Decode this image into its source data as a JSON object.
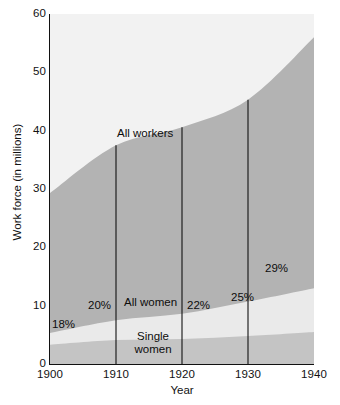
{
  "chart_data": {
    "type": "area",
    "title": "",
    "subtitle": "",
    "xlabel": "Year",
    "ylabel": "Work force (in millions)",
    "xlim": [
      1900,
      1940
    ],
    "ylim": [
      0,
      60
    ],
    "xticks": [
      1900,
      1910,
      1920,
      1930,
      1940
    ],
    "yticks": [
      0,
      10,
      20,
      30,
      40,
      50,
      60
    ],
    "grid": false,
    "legend": "inline-annotations",
    "stacked": false,
    "x": [
      1900,
      1910,
      1920,
      1930,
      1940
    ],
    "series": [
      {
        "name": "All workers",
        "values": [
          29.3,
          37.5,
          40.6,
          45.3,
          56.0
        ],
        "color": "#b3b3b3",
        "label": "All workers"
      },
      {
        "name": "All women",
        "values": [
          5.3,
          7.5,
          8.6,
          10.7,
          13.0
        ],
        "color": "#eaeaea",
        "label": "All women"
      },
      {
        "name": "Single women",
        "values": [
          3.3,
          4.1,
          4.3,
          4.8,
          5.5
        ],
        "color": "#c4c4c4",
        "label": "Single women"
      }
    ],
    "annotations": [
      {
        "text": "18%",
        "x": 1901,
        "y": 6.6
      },
      {
        "text": "20%",
        "x": 1907.5,
        "y": 9.6
      },
      {
        "text": "22%",
        "x": 1921,
        "y": 9.6
      },
      {
        "text": "25%",
        "x": 1928,
        "y": 10.9
      },
      {
        "text": "29%",
        "x": 1936,
        "y": 15.0
      }
    ],
    "percent_labels": [
      "18%",
      "20%",
      "22%",
      "25%",
      "29%"
    ],
    "reference_lines": [
      1910,
      1920,
      1930
    ],
    "colors": {
      "plot_background": "#f2f2f2",
      "all_workers_fill": "#b3b3b3",
      "all_women_fill": "#eaeaea",
      "single_women_fill": "#c4c4c4",
      "axis": "#111111",
      "text": "#0d0d0d"
    }
  },
  "axes": {
    "y_title": "Work force (in millions)",
    "x_title": "Year",
    "y_tick_labels": [
      "60",
      "50",
      "40",
      "30",
      "20",
      "10",
      "0"
    ],
    "x_tick_labels": [
      "1900",
      "1910",
      "1920",
      "1930",
      "1940"
    ]
  },
  "labels": {
    "all_workers": "All workers",
    "all_women": "All women",
    "single_women_line1": "Single",
    "single_women_line2": "women",
    "pct_1900": "18%",
    "pct_1910": "20%",
    "pct_1920": "22%",
    "pct_1930": "25%",
    "pct_1940": "29%"
  }
}
